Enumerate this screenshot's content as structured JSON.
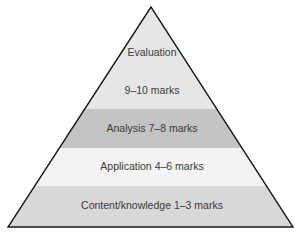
{
  "diagram": {
    "type": "pyramid",
    "levels": [
      {
        "id": "evaluation",
        "lines": [
          "Evaluation",
          "9–10 marks"
        ],
        "color": "#e6e6e6"
      },
      {
        "id": "analysis",
        "label": "Analysis 7–8 marks",
        "color": "#c4c4c4"
      },
      {
        "id": "application",
        "label": "Application 4–6 marks",
        "color": "#f3f3f3"
      },
      {
        "id": "content",
        "label": "Content/knowledge 1–3 marks",
        "color": "#d8d8d8"
      }
    ],
    "outline_color": "#1a1a1a"
  }
}
